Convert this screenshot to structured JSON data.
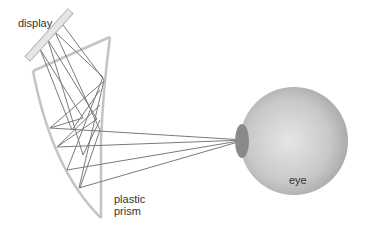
{
  "diagram": {
    "labels": {
      "display": "display",
      "prism_line1": "plastic",
      "prism_line2": "prism",
      "eye": "eye"
    },
    "colors": {
      "prism_stroke": "#c4c4c4",
      "ray_stroke": "#7a7a7a",
      "display_fill": "#e6e6e6",
      "display_stroke": "#b4b4b4",
      "eye_light": "#e4e4e4",
      "eye_dark": "#a9a9a9",
      "pupil": "#8a8a8a",
      "text": "#333333"
    }
  }
}
